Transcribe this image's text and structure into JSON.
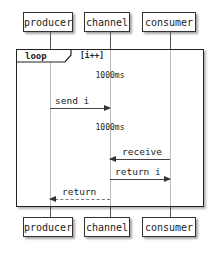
{
  "participants": [
    {
      "id": "producer",
      "label": "producer"
    },
    {
      "id": "channel",
      "label": "channel"
    },
    {
      "id": "consumer",
      "label": "consumer"
    }
  ],
  "loop": {
    "keyword": "loop",
    "guard": "[i++]"
  },
  "delays": [
    "1000ms",
    "1000ms"
  ],
  "messages": [
    {
      "from": "producer",
      "to": "channel",
      "label": "send i",
      "style": "solid"
    },
    {
      "from": "consumer",
      "to": "channel",
      "label": "receive",
      "style": "solid"
    },
    {
      "from": "channel",
      "to": "consumer",
      "label": "return i",
      "style": "solid"
    },
    {
      "from": "channel",
      "to": "producer",
      "label": "return",
      "style": "dashed"
    }
  ]
}
